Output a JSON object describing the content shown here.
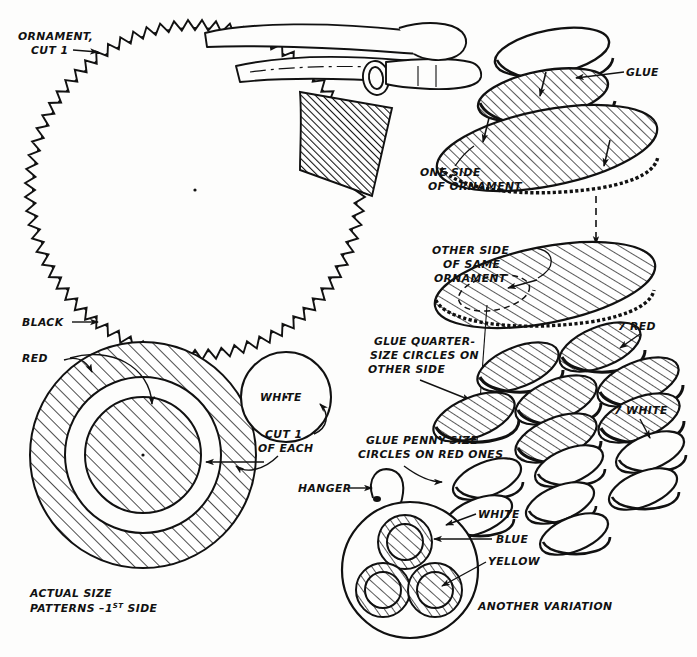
{
  "document": {
    "kind": "craft-instruction-diagram",
    "title": "Pinked-Edge Paper Ornament Assembly",
    "background": "#fdfdfc",
    "ink": "#111111"
  },
  "labels": {
    "ornament_cut1_line1": "ORNAMENT,",
    "ornament_cut1_line2": "CUT 1",
    "black": "BLACK",
    "red": "RED",
    "white": "WHITE",
    "cut1_line1": "CUT 1",
    "cut1_line2": "OF EACH",
    "actual_size_line1": "ACTUAL SIZE",
    "actual_size_line2_pre": "PATTERNS –1",
    "actual_size_line2_sup": "ST",
    "actual_size_line2_post": " SIDE",
    "glue": "GLUE",
    "one_side_line1": "ONE SIDE",
    "one_side_line2": "OF ORNAMENT",
    "other_side_line1": "OTHER SIDE",
    "other_side_line2": "OF SAME",
    "other_side_line3": "ORNAMENT",
    "glue_quarter_line1": "GLUE QUARTER-",
    "glue_quarter_line2": "SIZE CIRCLES ON",
    "glue_quarter_line3": "OTHER SIDE",
    "glue_penny_line1": "GLUE PENNY-SIZE",
    "glue_penny_line2": "CIRCLES ON RED ONES",
    "seven_red": "7 RED",
    "seven_white": "7 WHITE",
    "hanger": "HANGER",
    "var_white": "WHITE",
    "var_blue": "BLUE",
    "var_yellow": "YELLOW",
    "another_variation": "ANOTHER VARIATION"
  },
  "colors_referenced": [
    "BLACK",
    "RED",
    "WHITE",
    "BLUE",
    "YELLOW"
  ],
  "counts": {
    "ornament_cut": 1,
    "red_circles": 7,
    "white_circles": 7,
    "variation_inner_discs": 3,
    "pattern_rings": 3
  },
  "chart_data": {
    "type": "table",
    "columns": [
      "Part",
      "Color",
      "Quantity",
      "Note"
    ],
    "rows": [
      [
        "Ornament disc (pinked edge)",
        "BLACK",
        "1",
        "ORNAMENT, CUT 1"
      ],
      [
        "Large pattern ring",
        "RED",
        "1",
        "ACTUAL SIZE PATTERNS –1ST SIDE"
      ],
      [
        "Quarter-size circle",
        "RED",
        "7",
        "7 RED"
      ],
      [
        "Penny-size circle",
        "WHITE",
        "7",
        "7 WHITE"
      ],
      [
        "Small pattern circle",
        "WHITE",
        "1",
        "CUT 1 OF EACH"
      ],
      [
        "Variation inner disc",
        "BLUE",
        "3",
        "ANOTHER VARIATION"
      ],
      [
        "Variation accent",
        "YELLOW",
        "1",
        "ANOTHER VARIATION"
      ]
    ]
  }
}
